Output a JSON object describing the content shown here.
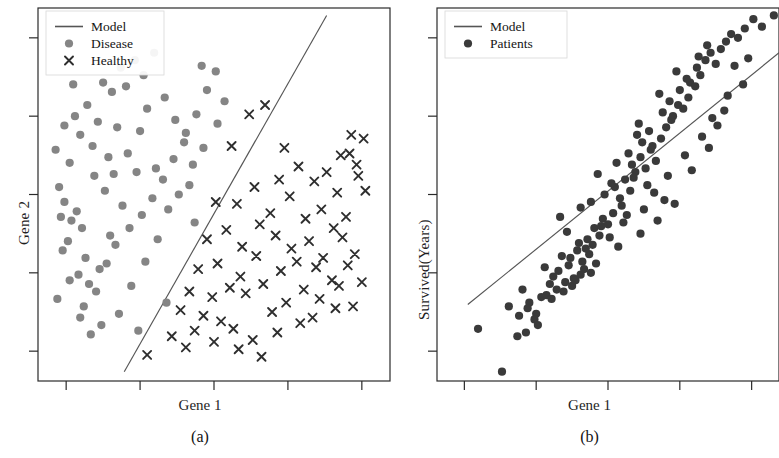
{
  "figure": {
    "panels": [
      {
        "id": "a",
        "subcaption": "(a)",
        "xlabel": "Gene 1",
        "ylabel": "Gene 2",
        "legend": {
          "model_label": "Model",
          "disease_label": "Disease",
          "healthy_label": "Healthy"
        }
      },
      {
        "id": "b",
        "subcaption": "(b)",
        "xlabel": "Gene 1",
        "ylabel": "Survived(Years)",
        "legend": {
          "model_label": "Model",
          "patients_label": "Patients"
        }
      }
    ]
  },
  "colors": {
    "disease_marker": "#858585",
    "healthy_marker": "#2e2e2e",
    "patients_marker": "#3a3a3a",
    "model_line": "#555555",
    "axis": "#2a2a2a",
    "background": "#ffffff"
  },
  "chart_data": [
    {
      "type": "scatter",
      "panel": "(a)",
      "title": "",
      "xlabel": "Gene 1",
      "ylabel": "Gene 2",
      "xlim": [
        0,
        100
      ],
      "ylim": [
        0,
        100
      ],
      "grid": false,
      "legend_position": "top-left",
      "xticks": [
        8,
        29,
        50,
        71,
        92
      ],
      "yticks": [
        8,
        29,
        50,
        71,
        92
      ],
      "xticklabels": [
        "",
        "",
        "",
        "",
        ""
      ],
      "yticklabels": [
        "",
        "",
        "",
        "",
        ""
      ],
      "annotations": [
        "Linear decision boundary separating Disease from Healthy"
      ],
      "series": [
        {
          "name": "Model",
          "type": "line",
          "comment": "decision boundary line, plotted in axis-fraction coords",
          "x": [
            24.5,
            82.0
          ],
          "y": [
            2.5,
            98.0
          ]
        },
        {
          "name": "Disease",
          "type": "scatter",
          "marker": "circle",
          "color": "#858585",
          "x": [
            5.0,
            9.0,
            10.5,
            12.0,
            7.5,
            14.0,
            17.0,
            18.5,
            16.0,
            21.0,
            23.5,
            20.0,
            12.5,
            8.5,
            6.0,
            11.0,
            13.5,
            15.5,
            19.0,
            22.5,
            25.0,
            27.5,
            30.0,
            33.0,
            36.0,
            39.0,
            41.5,
            44.0,
            46.5,
            31.0,
            28.0,
            24.0,
            20.5,
            17.5,
            14.5,
            11.5,
            9.5,
            7.0,
            5.5,
            13.0,
            16.5,
            19.5,
            22.0,
            26.0,
            29.5,
            32.5,
            35.5,
            38.5,
            42.0,
            45.0,
            48.0,
            50.5,
            53.0,
            43.0,
            37.0,
            34.0,
            30.5,
            26.5,
            23.0,
            18.0,
            15.0,
            12.0,
            9.0,
            6.5,
            21.5,
            25.5,
            29.0,
            33.5,
            40.0,
            47.0,
            51.0,
            44.5,
            36.5,
            28.5,
            10.0,
            7.5
          ],
          "y": [
            62.0,
            58.5,
            71.0,
            66.0,
            48.0,
            74.0,
            69.5,
            80.0,
            55.0,
            77.5,
            84.0,
            60.0,
            41.0,
            37.5,
            52.0,
            45.5,
            33.0,
            63.0,
            51.0,
            68.0,
            79.0,
            86.0,
            82.0,
            88.0,
            76.0,
            70.0,
            64.0,
            58.0,
            84.5,
            73.0,
            56.0,
            47.0,
            39.0,
            30.0,
            26.0,
            28.5,
            43.0,
            35.0,
            22.0,
            20.0,
            24.0,
            31.5,
            36.5,
            41.0,
            44.5,
            49.0,
            54.0,
            59.5,
            66.5,
            71.5,
            78.0,
            83.0,
            75.0,
            52.5,
            46.0,
            38.0,
            32.0,
            25.5,
            18.0,
            15.0,
            12.5,
            17.0,
            27.0,
            44.0,
            55.5,
            61.0,
            67.0,
            57.0,
            50.0,
            62.5,
            69.0,
            42.5,
            21.0,
            13.5,
            79.5,
            68.5
          ]
        },
        {
          "name": "Healthy",
          "type": "scatter",
          "marker": "x",
          "color": "#2e2e2e",
          "x": [
            60.0,
            64.5,
            55.0,
            70.0,
            89.0,
            92.5,
            86.0,
            90.5,
            68.5,
            74.0,
            78.5,
            82.0,
            85.0,
            88.5,
            91.0,
            50.5,
            56.5,
            61.5,
            66.0,
            71.5,
            76.0,
            80.5,
            84.0,
            87.5,
            93.0,
            48.0,
            53.5,
            58.0,
            63.0,
            67.5,
            72.0,
            77.0,
            81.0,
            86.5,
            90.0,
            45.5,
            51.0,
            57.5,
            62.0,
            69.0,
            73.5,
            79.0,
            83.5,
            88.0,
            92.0,
            43.0,
            49.5,
            54.5,
            59.0,
            64.0,
            70.5,
            75.5,
            80.0,
            85.5,
            89.5,
            40.5,
            47.0,
            52.0,
            66.5,
            74.5,
            78.0,
            84.5,
            38.0,
            44.5,
            55.5,
            61.0,
            68.0,
            31.0,
            42.0,
            50.0,
            57.0,
            63.5
          ],
          "y": [
            71.5,
            74.0,
            63.0,
            62.5,
            66.0,
            65.0,
            60.5,
            58.0,
            54.0,
            57.5,
            53.5,
            56.0,
            50.5,
            61.0,
            55.0,
            48.0,
            47.5,
            52.0,
            45.0,
            49.5,
            43.5,
            46.0,
            41.0,
            44.0,
            51.0,
            38.0,
            40.5,
            36.0,
            42.0,
            39.0,
            35.5,
            37.5,
            33.0,
            38.5,
            34.0,
            30.0,
            31.5,
            28.0,
            33.5,
            29.5,
            32.0,
            30.5,
            27.0,
            31.0,
            26.5,
            24.0,
            22.5,
            25.0,
            23.5,
            26.0,
            21.0,
            24.5,
            22.0,
            25.5,
            20.0,
            19.0,
            17.5,
            16.0,
            18.5,
            15.5,
            17.0,
            19.5,
            12.0,
            13.5,
            14.0,
            11.0,
            13.0,
            7.0,
            9.0,
            10.5,
            8.5,
            6.5
          ]
        }
      ]
    },
    {
      "type": "scatter",
      "panel": "(b)",
      "title": "",
      "xlabel": "Gene 1",
      "ylabel": "Survived(Years)",
      "xlim": [
        0,
        100
      ],
      "ylim": [
        0,
        100
      ],
      "grid": false,
      "legend_position": "top-left",
      "xticks": [
        8,
        29,
        50,
        71,
        92
      ],
      "yticks": [
        8,
        29,
        50,
        71,
        92
      ],
      "xticklabels": [
        "",
        "",
        "",
        "",
        ""
      ],
      "yticklabels": [
        "",
        "",
        "",
        "",
        ""
      ],
      "annotations": [
        "Linear regression fit through patient survival data"
      ],
      "series": [
        {
          "name": "Model",
          "type": "line",
          "comment": "regression line in axis-fraction coords",
          "x": [
            9.0,
            100.0
          ],
          "y": [
            20.5,
            88.0
          ]
        },
        {
          "name": "Patients",
          "type": "scatter",
          "marker": "circle",
          "color": "#3a3a3a",
          "x": [
            12.0,
            34.0,
            38.5,
            27.0,
            29.0,
            30.5,
            25.0,
            26.5,
            33.0,
            35.5,
            37.0,
            39.0,
            41.0,
            42.5,
            44.0,
            45.5,
            40.0,
            43.0,
            46.0,
            47.5,
            48.5,
            50.0,
            51.5,
            36.0,
            38.0,
            42.0,
            45.0,
            49.0,
            52.0,
            53.5,
            55.0,
            56.5,
            58.0,
            54.0,
            51.0,
            47.0,
            44.5,
            41.5,
            57.0,
            59.5,
            61.0,
            62.5,
            64.0,
            60.0,
            58.5,
            56.0,
            63.0,
            65.5,
            67.0,
            68.5,
            66.0,
            62.0,
            59.0,
            69.0,
            70.5,
            72.0,
            73.5,
            71.0,
            68.0,
            65.0,
            74.0,
            75.5,
            77.0,
            76.0,
            73.0,
            70.0,
            78.5,
            80.0,
            81.5,
            79.0,
            76.5,
            83.0,
            84.5,
            86.0,
            88.0,
            90.0,
            92.5,
            95.0,
            98.5,
            85.0,
            82.0,
            79.5,
            87.0,
            89.5,
            91.0,
            55.5,
            48.0,
            43.5,
            39.5,
            32.0,
            28.5,
            24.0,
            21.0,
            31.5,
            36.5,
            52.5,
            57.5,
            61.5,
            66.5,
            72.5,
            77.5,
            84.0,
            67.5,
            63.5,
            60.5,
            54.5,
            50.5,
            46.5,
            42.0,
            37.5,
            33.5,
            29.5,
            26.0,
            23.5,
            19.0,
            80.5,
            74.5,
            69.5,
            64.5,
            59.5,
            53.0,
            45.0,
            40.5,
            35.0
          ],
          "y": [
            14.0,
            28.0,
            31.0,
            21.0,
            18.0,
            22.5,
            24.5,
            19.5,
            26.0,
            29.5,
            24.0,
            33.0,
            35.0,
            32.0,
            38.0,
            36.5,
            27.5,
            30.0,
            41.0,
            39.0,
            43.5,
            42.0,
            45.0,
            44.0,
            40.0,
            46.5,
            48.0,
            50.0,
            52.0,
            49.0,
            54.0,
            51.0,
            56.0,
            47.0,
            53.0,
            55.5,
            34.0,
            37.0,
            58.0,
            60.0,
            57.0,
            62.0,
            59.0,
            64.0,
            66.0,
            61.0,
            63.0,
            65.0,
            68.0,
            70.0,
            72.0,
            67.0,
            69.0,
            71.0,
            74.0,
            73.0,
            76.0,
            78.0,
            75.0,
            77.0,
            80.0,
            79.0,
            82.0,
            84.0,
            81.0,
            83.0,
            86.0,
            88.0,
            85.0,
            90.0,
            87.0,
            89.0,
            91.0,
            93.0,
            92.0,
            94.5,
            97.0,
            95.0,
            98.0,
            76.5,
            68.5,
            62.5,
            84.5,
            79.5,
            86.5,
            44.5,
            41.5,
            35.5,
            25.5,
            23.0,
            16.5,
            17.5,
            20.0,
            30.5,
            33.5,
            58.5,
            54.5,
            52.5,
            48.5,
            60.5,
            65.5,
            72.5,
            55.0,
            50.5,
            46.0,
            42.5,
            38.5,
            31.5,
            28.5,
            26.5,
            22.0,
            15.0,
            13.0,
            12.0,
            2.5,
            70.5,
            56.5,
            47.5,
            43.0,
            39.5,
            36.0,
            29.0,
            27.0,
            24.5
          ]
        }
      ]
    }
  ]
}
